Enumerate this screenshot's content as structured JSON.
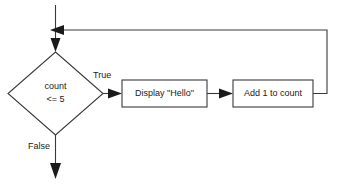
{
  "diagram": {
    "background_color": "#ffffff",
    "line_color": "#3a3a3a",
    "text_color": "#1a1a1a",
    "nodes": {
      "decision": {
        "shape": "diamond",
        "line1": "count",
        "line2": "<= 5"
      },
      "process_display": {
        "shape": "rectangle",
        "label": "Display \"Hello\""
      },
      "process_increment": {
        "shape": "rectangle",
        "label": "Add 1 to count"
      }
    },
    "edge_labels": {
      "true_branch": "True",
      "false_branch": "False"
    }
  }
}
